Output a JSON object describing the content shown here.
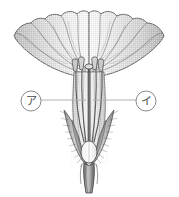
{
  "figure": {
    "background_color": "#ffffff",
    "outline_color": "#555555",
    "petal_fill_light": "#f2f2f2",
    "petal_fill_mid": "#d8d8d8",
    "petal_fill_dark": "#b4b4b4",
    "leader_line_color": "#b0b0b0",
    "label_text_color": "#4a4a4a",
    "width": 179,
    "height": 197
  },
  "labels": [
    {
      "id": "label-a",
      "text": "ア",
      "circle_cx": 31,
      "circle_cy": 101,
      "circle_r": 10,
      "leader_from_x": 41,
      "leader_to_x": 80,
      "leader_y": 100,
      "side": "left"
    },
    {
      "id": "label-i",
      "text": "イ",
      "circle_cx": 146,
      "circle_cy": 101,
      "circle_r": 10,
      "leader_from_x": 136,
      "leader_to_x": 99,
      "leader_y": 100,
      "side": "right"
    }
  ],
  "parts": [
    {
      "id": "corolla",
      "name": "corolla-funnel"
    },
    {
      "id": "petal-lobes",
      "name": "petal-lobe-edge"
    },
    {
      "id": "petal-veins",
      "name": "petal-vein-lines"
    },
    {
      "id": "stamens",
      "name": "stamen-group"
    },
    {
      "id": "anthers",
      "name": "anther-heads"
    },
    {
      "id": "pistil",
      "name": "pistil-style"
    },
    {
      "id": "stigma",
      "name": "stigma-head"
    },
    {
      "id": "ovary",
      "name": "ovary"
    },
    {
      "id": "sepals",
      "name": "sepal-calyx"
    },
    {
      "id": "sepal-hairs",
      "name": "sepal-hair-texture"
    },
    {
      "id": "stalk",
      "name": "flower-stalk"
    }
  ]
}
